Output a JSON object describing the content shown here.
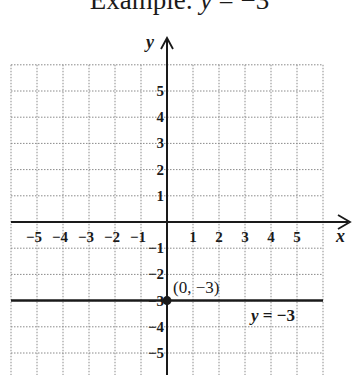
{
  "title": {
    "prefix": "Example: ",
    "var": "y",
    "rest": " = −3"
  },
  "chart_data": {
    "type": "line",
    "title": "Example: y = −3",
    "xlabel": "x",
    "ylabel": "y",
    "xlim": [
      -6,
      6
    ],
    "ylim": [
      -6,
      6
    ],
    "grid": true,
    "x_ticks": [
      "−5",
      "−4",
      "−3",
      "−2",
      "−1",
      "1",
      "2",
      "3",
      "4",
      "5"
    ],
    "y_ticks": [
      "5",
      "4",
      "3",
      "2",
      "1",
      "−1",
      "−2",
      "−3",
      "−4",
      "−5"
    ],
    "series": [
      {
        "name": "y = −3",
        "x": [
          -6,
          6
        ],
        "y": [
          -3,
          -3
        ]
      }
    ],
    "points": [
      {
        "x": 0,
        "y": -3,
        "label": "(0, −3)"
      }
    ],
    "annotations": [
      {
        "text": "(0, −3)",
        "x": 0,
        "y": -3
      },
      {
        "text": "y = −3",
        "x": 3.5,
        "y": -3.5
      }
    ]
  },
  "labels": {
    "x_axis": "x",
    "y_axis": "y",
    "point": "(0, −3)",
    "line_var": "y",
    "line_rest": " = −3"
  },
  "colors": {
    "ink": "#1a1a1a",
    "grid": "#8a8a8a"
  }
}
